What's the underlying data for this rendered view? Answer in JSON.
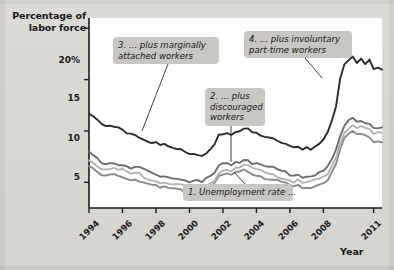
{
  "figure": {
    "y_axis_title_line1": "Percentage of",
    "y_axis_title_line2": "labor force",
    "x_axis_title": "Year"
  },
  "callouts": {
    "c1_line1": "1. Unemployment rate ...",
    "c2_line1": "2. ... plus",
    "c2_line2": "discouraged",
    "c2_line3": "workers",
    "c3_line1": "3. ... plus marginally",
    "c3_line2": "attached workers",
    "c4_line1": "4. ... plus involuntary",
    "c4_line2": "part-time workers"
  },
  "colors": {
    "series1": "#8a8a8a",
    "series2": "#b4b4b4",
    "series3": "#6e6e6e",
    "series4": "#2b2b2b",
    "plot_background": "#ffffff",
    "page_background": "#d9d7d2",
    "callout_background": "#c9c7c2",
    "axis": "#1b1b1e"
  },
  "chart_data": {
    "type": "line",
    "title": "",
    "xlabel": "Year",
    "ylabel": "Percentage of labor force",
    "xlim": [
      1994,
      2011.5
    ],
    "ylim": [
      2.5,
      21
    ],
    "grid": false,
    "legend": "annotations",
    "ytick_labels": [
      "20%",
      "15",
      "10",
      "5"
    ],
    "ytick_values": [
      20,
      15,
      10,
      5
    ],
    "xtick_labels": [
      "1994",
      "1996",
      "1998",
      "2000",
      "2002",
      "2004",
      "2006",
      "2008",
      "2011"
    ],
    "xtick_values": [
      1994,
      1996,
      1998,
      2000,
      2002,
      2004,
      2006,
      2008,
      2011
    ],
    "x": [
      1994.0,
      1994.25,
      1994.5,
      1994.75,
      1995.0,
      1995.25,
      1995.5,
      1995.75,
      1996.0,
      1996.25,
      1996.5,
      1996.75,
      1997.0,
      1997.25,
      1997.5,
      1997.75,
      1998.0,
      1998.25,
      1998.5,
      1998.75,
      1999.0,
      1999.25,
      1999.5,
      1999.75,
      2000.0,
      2000.25,
      2000.5,
      2000.75,
      2001.0,
      2001.25,
      2001.5,
      2001.75,
      2002.0,
      2002.25,
      2002.5,
      2002.75,
      2003.0,
      2003.25,
      2003.5,
      2003.75,
      2004.0,
      2004.25,
      2004.5,
      2004.75,
      2005.0,
      2005.25,
      2005.5,
      2005.75,
      2006.0,
      2006.25,
      2006.5,
      2006.75,
      2007.0,
      2007.25,
      2007.5,
      2007.75,
      2008.0,
      2008.25,
      2008.5,
      2008.75,
      2009.0,
      2009.25,
      2009.5,
      2009.75,
      2010.0,
      2010.25,
      2010.5,
      2010.75,
      2011.0,
      2011.25,
      2011.5
    ],
    "series": [
      {
        "name": "1. Unemployment rate (U-3)",
        "color": "#8a8a8a",
        "values": [
          6.6,
          6.2,
          6.0,
          5.6,
          5.6,
          5.7,
          5.7,
          5.6,
          5.6,
          5.4,
          5.2,
          5.3,
          5.2,
          5.0,
          4.9,
          4.7,
          4.6,
          4.4,
          4.5,
          4.4,
          4.3,
          4.3,
          4.2,
          4.1,
          4.0,
          4.0,
          4.0,
          3.9,
          4.2,
          4.4,
          4.8,
          5.5,
          5.7,
          5.8,
          5.7,
          5.9,
          5.9,
          6.1,
          6.1,
          5.8,
          5.7,
          5.6,
          5.4,
          5.4,
          5.3,
          5.1,
          5.0,
          4.9,
          4.7,
          4.6,
          4.7,
          4.4,
          4.5,
          4.5,
          4.7,
          4.8,
          5.0,
          5.3,
          6.1,
          6.9,
          8.2,
          9.3,
          9.6,
          10.0,
          9.7,
          9.7,
          9.5,
          9.5,
          9.0,
          9.1,
          9.0
        ],
        "label_point": {
          "x": 2004.1,
          "y": 5.35
        }
      },
      {
        "name": "2. ... plus discouraged workers",
        "color": "#b4b4b4",
        "values": [
          7.3,
          6.9,
          6.7,
          6.3,
          6.3,
          6.3,
          6.3,
          6.2,
          6.2,
          6.0,
          5.8,
          5.9,
          5.8,
          5.6,
          5.4,
          5.2,
          5.1,
          4.9,
          5.0,
          4.9,
          4.8,
          4.8,
          4.7,
          4.6,
          4.5,
          4.5,
          4.5,
          4.4,
          4.7,
          4.9,
          5.3,
          6.0,
          6.2,
          6.3,
          6.2,
          6.4,
          6.4,
          6.6,
          6.6,
          6.3,
          6.2,
          6.1,
          5.9,
          5.9,
          5.8,
          5.6,
          5.5,
          5.4,
          5.2,
          5.1,
          5.2,
          4.9,
          5.0,
          5.0,
          5.2,
          5.3,
          5.5,
          5.8,
          6.6,
          7.5,
          8.8,
          9.9,
          10.3,
          10.7,
          10.4,
          10.4,
          10.2,
          10.2,
          9.7,
          9.8,
          9.7
        ],
        "label_point": {
          "x": 2003.5,
          "y": 6.6
        }
      },
      {
        "name": "3. ... plus marginally attached workers",
        "color": "#6e6e6e",
        "values": [
          7.9,
          7.5,
          7.3,
          6.9,
          6.9,
          6.9,
          6.9,
          6.8,
          6.8,
          6.6,
          6.4,
          6.5,
          6.4,
          6.2,
          6.0,
          5.8,
          5.7,
          5.5,
          5.6,
          5.5,
          5.4,
          5.4,
          5.3,
          5.2,
          5.1,
          5.1,
          5.1,
          5.0,
          5.3,
          5.5,
          5.9,
          6.6,
          6.8,
          6.9,
          6.8,
          7.0,
          7.0,
          7.2,
          7.2,
          6.9,
          6.8,
          6.7,
          6.5,
          6.5,
          6.4,
          6.2,
          6.1,
          6.0,
          5.8,
          5.7,
          5.8,
          5.5,
          5.6,
          5.6,
          5.8,
          5.9,
          6.1,
          6.4,
          7.2,
          8.1,
          9.4,
          10.5,
          10.9,
          11.3,
          11.0,
          11.0,
          10.8,
          10.8,
          10.3,
          10.4,
          10.3
        ],
        "label_point": {
          "x": 1996.6,
          "y": 6.3
        }
      },
      {
        "name": "4. ... plus involuntary part-time workers",
        "color": "#2b2b2b",
        "values": [
          11.7,
          11.3,
          11.0,
          10.6,
          10.4,
          10.4,
          10.3,
          10.2,
          10.2,
          9.9,
          9.8,
          9.7,
          9.5,
          9.3,
          9.1,
          8.9,
          8.8,
          8.6,
          8.6,
          8.5,
          8.3,
          8.2,
          8.1,
          8.0,
          7.9,
          7.8,
          7.7,
          7.6,
          7.9,
          8.3,
          8.8,
          9.5,
          9.6,
          9.7,
          9.6,
          9.8,
          9.9,
          10.1,
          10.3,
          10.0,
          9.9,
          9.7,
          9.5,
          9.5,
          9.3,
          9.0,
          8.8,
          8.6,
          8.4,
          8.3,
          8.3,
          8.1,
          8.3,
          8.3,
          8.5,
          8.8,
          9.2,
          9.9,
          11.0,
          12.5,
          15.0,
          16.4,
          16.8,
          17.2,
          16.6,
          17.0,
          16.5,
          16.9,
          16.1,
          16.2,
          16.1
        ],
        "label_point": {
          "x": 2009.2,
          "y": 15.8
        }
      }
    ]
  }
}
